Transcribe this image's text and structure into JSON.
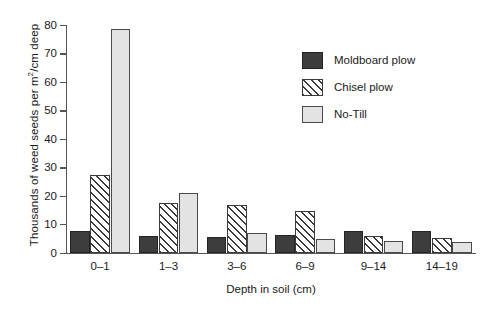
{
  "chart_data": {
    "type": "bar",
    "title": "",
    "xlabel": "Depth in soil (cm)",
    "ylabel": "Thousands of weed seeds per m2/cm deep",
    "ylabel_parts": {
      "pre": "Thousands of weed seeds per m",
      "sup": "2",
      "post": "/cm deep"
    },
    "categories": [
      "0–1",
      "1–3",
      "3–6",
      "6–9",
      "9–14",
      "14–19"
    ],
    "series": [
      {
        "name": "Moldboard plow",
        "values": [
          7.8,
          6.0,
          5.5,
          6.1,
          7.5,
          7.6
        ],
        "color": "#3d3d3d",
        "fill": "solid-dark"
      },
      {
        "name": "Chisel plow",
        "values": [
          27.3,
          17.5,
          16.7,
          14.6,
          6.0,
          5.0
        ],
        "color": "#ffffff",
        "fill": "diagonal-hatch"
      },
      {
        "name": "No-Till",
        "values": [
          78.5,
          21.0,
          7.0,
          4.7,
          4.2,
          3.8
        ],
        "color": "#e3e3e3",
        "fill": "solid-light"
      }
    ],
    "ylim": [
      0,
      80
    ],
    "yticks": [
      0,
      10,
      20,
      30,
      40,
      50,
      60,
      70,
      80
    ],
    "ytick_labels": [
      "0",
      "10",
      "20",
      "30",
      "40",
      "50",
      "60",
      "70",
      "80"
    ],
    "grid": false,
    "legend_position": "upper right",
    "legend_frame": false
  },
  "legend": {
    "entries": [
      {
        "label": "Moldboard plow"
      },
      {
        "label": "Chisel plow"
      },
      {
        "label": "No-Till"
      }
    ]
  }
}
